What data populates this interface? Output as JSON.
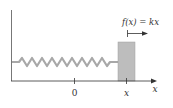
{
  "diagram": {
    "force_label": "f(x) = kx",
    "origin_label": "0",
    "position_label": "x",
    "axis_label": "x",
    "colors": {
      "spring": "#a8a8a8",
      "block": "#bdbdbd",
      "block_edge": "#9a9a9a",
      "wall": "#777777",
      "axis": "#333333",
      "text": "#333333"
    },
    "spring_coils": 10
  }
}
